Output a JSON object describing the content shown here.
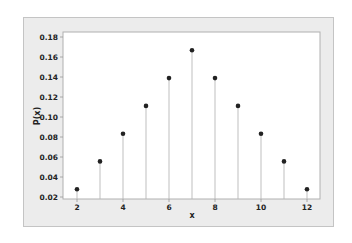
{
  "chart_data": {
    "type": "stem",
    "title": "",
    "xlabel": "x",
    "ylabel": "P(x)",
    "x": [
      2,
      3,
      4,
      5,
      6,
      7,
      8,
      9,
      10,
      11,
      12
    ],
    "values": [
      0.0278,
      0.0556,
      0.0833,
      0.1111,
      0.1389,
      0.1667,
      0.1389,
      0.1111,
      0.0833,
      0.0556,
      0.0278
    ],
    "x_ticks": [
      2,
      4,
      6,
      8,
      10,
      12
    ],
    "x_tick_labels": [
      "2",
      "4",
      "6",
      "8",
      "10",
      "12"
    ],
    "y_ticks": [
      0.02,
      0.04,
      0.06,
      0.08,
      0.1,
      0.12,
      0.14,
      0.16,
      0.18
    ],
    "y_tick_labels": [
      "0.02",
      "0.04",
      "0.06",
      "0.08",
      "0.10",
      "0.12",
      "0.14",
      "0.16",
      "0.18"
    ],
    "xlim": [
      1.6,
      12.6
    ],
    "ylim": [
      0.018,
      0.183
    ],
    "grid": false,
    "legend": null
  },
  "colors": {
    "frame_bg": "#ececec",
    "plot_bg": "#ffffff",
    "stem": "#b8b8b8",
    "marker": "#222222"
  }
}
